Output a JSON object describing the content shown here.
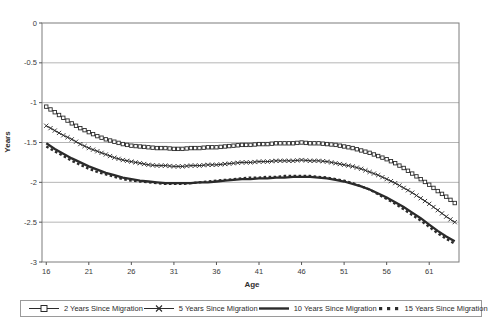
{
  "chart_data": {
    "type": "line",
    "title": "",
    "xlabel": "Age",
    "ylabel": "Years",
    "xlim": [
      15.5,
      64.5
    ],
    "ylim": [
      -3,
      0
    ],
    "grid": "horizontal",
    "legend_position": "bottom",
    "x_ticks": [
      {
        "value": 16,
        "label": "16"
      },
      {
        "value": 21,
        "label": "21"
      },
      {
        "value": 26,
        "label": "26"
      },
      {
        "value": 31,
        "label": "31"
      },
      {
        "value": 36,
        "label": "36"
      },
      {
        "value": 41,
        "label": "41"
      },
      {
        "value": 46,
        "label": "46"
      },
      {
        "value": 51,
        "label": "51"
      },
      {
        "value": 56,
        "label": "56"
      },
      {
        "value": 61,
        "label": "61"
      }
    ],
    "y_ticks": [
      {
        "value": 0,
        "label": "0"
      },
      {
        "value": -0.5,
        "label": "-0.5"
      },
      {
        "value": -1,
        "label": "-1"
      },
      {
        "value": -1.5,
        "label": "-1.5"
      },
      {
        "value": -2,
        "label": "-2"
      },
      {
        "value": -2.5,
        "label": "-2.5"
      },
      {
        "value": -3,
        "label": "-3"
      }
    ],
    "x": [
      16,
      17,
      18,
      19,
      20,
      21,
      22,
      23,
      24,
      25,
      26,
      27,
      28,
      29,
      30,
      31,
      32,
      33,
      34,
      35,
      36,
      37,
      38,
      39,
      40,
      41,
      42,
      43,
      44,
      45,
      46,
      47,
      48,
      49,
      50,
      51,
      52,
      53,
      54,
      55,
      56,
      57,
      58,
      59,
      60,
      61,
      62,
      63,
      64
    ],
    "series": [
      {
        "name": "2 Years Since Migration",
        "style": "square-marker",
        "values": [
          -1.05,
          -1.12,
          -1.19,
          -1.26,
          -1.32,
          -1.37,
          -1.42,
          -1.46,
          -1.49,
          -1.52,
          -1.54,
          -1.55,
          -1.56,
          -1.57,
          -1.57,
          -1.58,
          -1.58,
          -1.57,
          -1.57,
          -1.56,
          -1.56,
          -1.55,
          -1.54,
          -1.53,
          -1.53,
          -1.52,
          -1.52,
          -1.51,
          -1.51,
          -1.51,
          -1.5,
          -1.51,
          -1.51,
          -1.52,
          -1.53,
          -1.55,
          -1.57,
          -1.6,
          -1.63,
          -1.67,
          -1.71,
          -1.76,
          -1.82,
          -1.89,
          -1.96,
          -2.03,
          -2.11,
          -2.18,
          -2.26
        ]
      },
      {
        "name": "5 Years Since Migration",
        "style": "x-marker",
        "values": [
          -1.29,
          -1.35,
          -1.41,
          -1.46,
          -1.52,
          -1.57,
          -1.61,
          -1.65,
          -1.69,
          -1.72,
          -1.74,
          -1.76,
          -1.78,
          -1.79,
          -1.79,
          -1.8,
          -1.8,
          -1.79,
          -1.79,
          -1.78,
          -1.78,
          -1.77,
          -1.76,
          -1.75,
          -1.75,
          -1.74,
          -1.74,
          -1.73,
          -1.73,
          -1.73,
          -1.72,
          -1.73,
          -1.73,
          -1.74,
          -1.76,
          -1.78,
          -1.8,
          -1.83,
          -1.87,
          -1.91,
          -1.96,
          -2.01,
          -2.07,
          -2.13,
          -2.2,
          -2.27,
          -2.35,
          -2.43,
          -2.5
        ]
      },
      {
        "name": "10 Years Since Migration",
        "style": "thick-solid",
        "values": [
          -1.51,
          -1.58,
          -1.64,
          -1.7,
          -1.75,
          -1.8,
          -1.84,
          -1.88,
          -1.91,
          -1.94,
          -1.96,
          -1.98,
          -1.99,
          -2.0,
          -2.01,
          -2.01,
          -2.01,
          -2.01,
          -2.0,
          -2.0,
          -1.99,
          -1.98,
          -1.97,
          -1.96,
          -1.96,
          -1.95,
          -1.95,
          -1.94,
          -1.94,
          -1.93,
          -1.93,
          -1.93,
          -1.94,
          -1.95,
          -1.97,
          -1.99,
          -2.02,
          -2.05,
          -2.09,
          -2.14,
          -2.19,
          -2.25,
          -2.31,
          -2.38,
          -2.45,
          -2.53,
          -2.61,
          -2.68,
          -2.74
        ]
      },
      {
        "name": "15 Years Since Migration",
        "style": "thick-dashed",
        "values": [
          -1.55,
          -1.61,
          -1.67,
          -1.73,
          -1.78,
          -1.83,
          -1.87,
          -1.9,
          -1.93,
          -1.96,
          -1.98,
          -1.99,
          -2.0,
          -2.01,
          -2.02,
          -2.02,
          -2.02,
          -2.01,
          -2.0,
          -1.99,
          -1.98,
          -1.97,
          -1.96,
          -1.95,
          -1.94,
          -1.94,
          -1.93,
          -1.93,
          -1.92,
          -1.92,
          -1.92,
          -1.92,
          -1.93,
          -1.94,
          -1.96,
          -1.98,
          -2.01,
          -2.05,
          -2.09,
          -2.15,
          -2.21,
          -2.27,
          -2.34,
          -2.41,
          -2.48,
          -2.56,
          -2.64,
          -2.71,
          -2.77
        ]
      }
    ],
    "colors": {
      "line": "#2b2b2b",
      "grid": "#b5b5b5",
      "axis": "#7d7d7d",
      "tick": "#555555",
      "text": "#333333",
      "background": "#ffffff"
    }
  }
}
